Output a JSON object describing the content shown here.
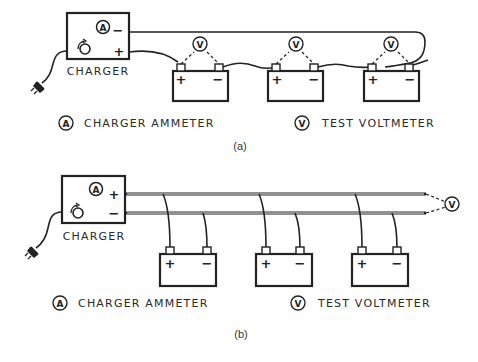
{
  "diagram_a": {
    "caption": "(a)",
    "charger": {
      "label": "CHARGER",
      "terminal_top": "−",
      "terminal_bottom": "+",
      "meter_symbol": "A"
    },
    "batteries": [
      {
        "plus": "+",
        "minus": "−",
        "meter": "V"
      },
      {
        "plus": "+",
        "minus": "−",
        "meter": "V"
      },
      {
        "plus": "+",
        "minus": "−",
        "meter": "V"
      }
    ],
    "legend": {
      "ammeter_symbol": "A",
      "ammeter_label": "CHARGER AMMETER",
      "voltmeter_symbol": "V",
      "voltmeter_label": "TEST VOLTMETER"
    }
  },
  "diagram_b": {
    "caption": "(b)",
    "charger": {
      "label": "CHARGER",
      "terminal_top": "+",
      "terminal_bottom": "−",
      "meter_symbol": "A"
    },
    "batteries": [
      {
        "plus": "+",
        "minus": "−"
      },
      {
        "plus": "+",
        "minus": "−"
      },
      {
        "plus": "+",
        "minus": "−"
      }
    ],
    "voltmeter_symbol": "V",
    "legend": {
      "ammeter_symbol": "A",
      "ammeter_label": "CHARGER AMMETER",
      "voltmeter_symbol": "V",
      "voltmeter_label": "TEST VOLTMETER"
    }
  }
}
